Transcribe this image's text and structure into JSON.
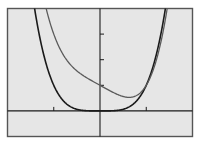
{
  "chart_data": {
    "type": "line",
    "title": "",
    "xlabel": "",
    "ylabel": "",
    "xlim": [
      -2,
      2
    ],
    "ylim": [
      -1,
      4
    ],
    "x_ticks": [
      -1,
      1
    ],
    "y_ticks": [
      1,
      2,
      3
    ],
    "tick_labels_shown": false,
    "grid": false,
    "legend": null,
    "series": [
      {
        "name": "f(x) = x^4",
        "color": "#1a1a1a",
        "expression": "x^4",
        "x": [
          -1.6,
          -1.4,
          -1.2,
          -1.0,
          -0.8,
          -0.6,
          -0.4,
          -0.2,
          0,
          0.2,
          0.4,
          0.6,
          0.8,
          1.0,
          1.2,
          1.4,
          1.6
        ],
        "y": [
          6.55,
          3.84,
          2.07,
          1.0,
          0.41,
          0.13,
          0.03,
          0.0,
          0,
          0.0,
          0.03,
          0.13,
          0.41,
          1.0,
          2.07,
          3.84,
          6.55
        ]
      },
      {
        "name": "g(x) = x^4 - x + 1",
        "color": "#5a5a5a",
        "expression": "x^4 - x + 1",
        "x": [
          -1.0,
          -0.8,
          -0.6,
          -0.4,
          -0.2,
          0,
          0.2,
          0.4,
          0.6,
          0.8,
          1.0,
          1.2,
          1.4,
          1.6
        ],
        "y": [
          3.0,
          2.21,
          1.73,
          1.43,
          1.2,
          1.0,
          0.8,
          0.63,
          0.53,
          0.61,
          1.0,
          1.87,
          3.44,
          5.95
        ]
      }
    ]
  },
  "colors": {
    "background": "#e6e6e6",
    "frame": "#555555",
    "axes": "#1a1a1a"
  }
}
